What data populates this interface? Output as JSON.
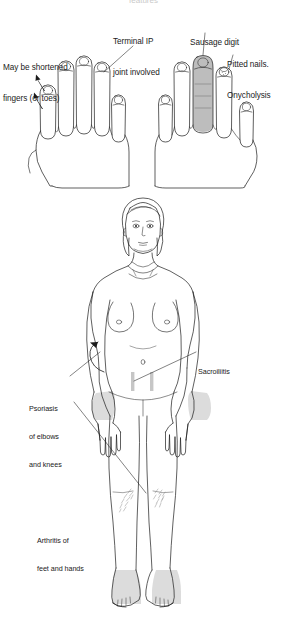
{
  "document": {
    "type": "medical-illustration",
    "subject": "Psoriatic arthritis clinical features",
    "background_color": "#ffffff",
    "ink_color": "#1b1b1b",
    "shading_color": "#c9c9c9",
    "accent_shading_color": "#b5b5b5",
    "cut_off_title": "features"
  },
  "panels": {
    "hands": {
      "name": "hands-panel",
      "caption_group": "Nail and digit changes in psoriatic arthritis",
      "labels": [
        {
          "id": "may-be-shortened",
          "text_lines": [
            "May be shortened",
            "fingers (or toes)"
          ],
          "points_to": "shortened-digit-left-hand"
        },
        {
          "id": "terminal-ip",
          "text_lines": [
            "Terminal IP",
            "joint involved"
          ],
          "points_to": "distal-interphalangeal-joint"
        },
        {
          "id": "sausage-digit",
          "text_lines": [
            "Sausage digit"
          ],
          "points_to": "dactylitis-digit"
        },
        {
          "id": "pitted-nails",
          "text_lines": [
            "Pitted nails.",
            "Onycholysis"
          ],
          "points_to": "affected-nail"
        }
      ]
    },
    "body": {
      "name": "body-panel",
      "figure_description": "Anterior view of a female body outline",
      "labels": [
        {
          "id": "psoriasis-elbows-knees",
          "text_lines": [
            "Psoriasis",
            "of elbows",
            "and knees"
          ],
          "points_to": "elbow-and-knee-plaques"
        },
        {
          "id": "sacroiliitis",
          "text_lines": [
            "Sacroiliitis"
          ],
          "points_to": "sacroiliac-joints"
        },
        {
          "id": "arthritis-feet-hands",
          "text_lines": [
            "Arthritis of",
            "feet and hands"
          ],
          "points_to": "hands-and-feet-joints"
        }
      ],
      "shaded_regions": [
        {
          "id": "sacroiliac-joint-bars",
          "count": 2,
          "color": "#c6c6c6"
        },
        {
          "id": "forearm-wrist-shading-left",
          "color": "#d9d9d9"
        },
        {
          "id": "forearm-wrist-shading-right",
          "color": "#d9d9d9"
        },
        {
          "id": "knee-plaque-left",
          "color": "#b9b9b9"
        },
        {
          "id": "knee-plaque-right",
          "color": "#b9b9b9"
        },
        {
          "id": "ankle-foot-shading-left",
          "color": "#dcdcdc"
        },
        {
          "id": "ankle-foot-shading-right",
          "color": "#dcdcdc"
        }
      ]
    }
  }
}
